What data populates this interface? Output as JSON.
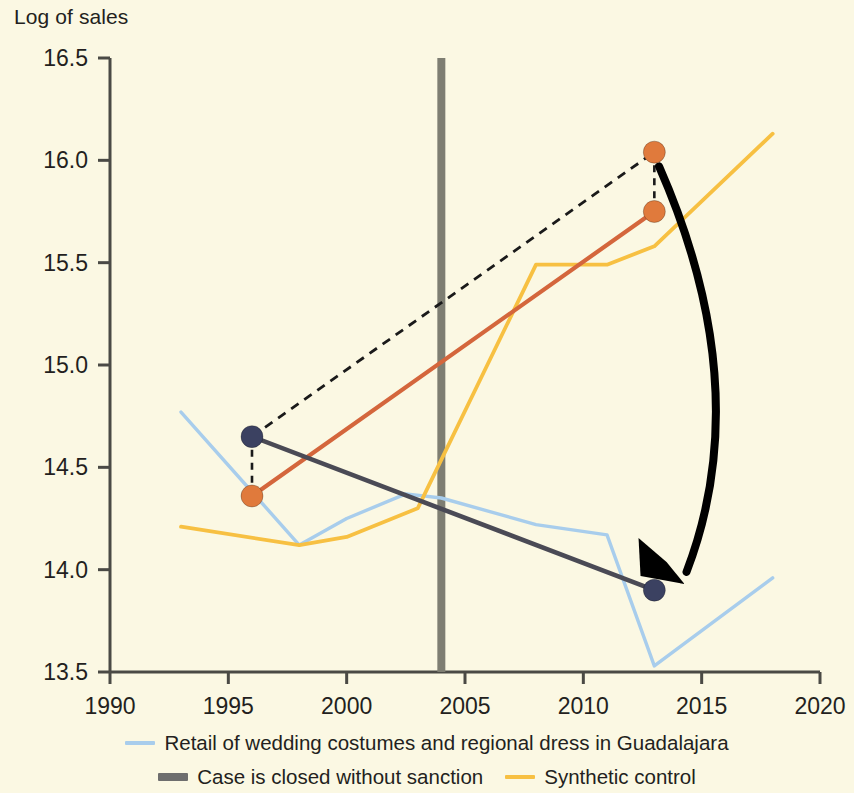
{
  "axis": {
    "y_title": "Log of sales",
    "y_ticks": [
      "13.5",
      "14.0",
      "14.5",
      "15.0",
      "15.5",
      "16.0",
      "16.5"
    ],
    "x_ticks": [
      "1990",
      "1995",
      "2000",
      "2005",
      "2010",
      "2015",
      "2020"
    ]
  },
  "legend": {
    "items": [
      {
        "label": "Retail of wedding costumes and regional dress in Guadalajara",
        "color": "#A8CDEC",
        "weight": "thin"
      },
      {
        "label": "Case is closed without sanction",
        "color": "#6E6E6E",
        "weight": "thick"
      },
      {
        "label": "Synthetic control",
        "color": "#F7C042",
        "weight": "thin"
      }
    ]
  },
  "colors": {
    "background": "#FBF8E3",
    "axis": "#4A4A45",
    "light_blue": "#A8CDEC",
    "yellow": "#F7C042",
    "orange_line": "#D4663C",
    "orange_dot": "#E07A3C",
    "navy_dot": "#3B4161",
    "dark_gray_line": "#4A4A55",
    "event_line": "#7E7E72",
    "arrow": "#000000",
    "dashed": "#1A1A1A"
  },
  "chart_data": {
    "type": "line",
    "title": "",
    "xlabel": "",
    "ylabel": "Log of sales",
    "xlim": [
      1990,
      2020
    ],
    "ylim": [
      13.5,
      16.5
    ],
    "grid": false,
    "legend_position": "bottom",
    "series": [
      {
        "name": "Retail of wedding costumes and regional dress in Guadalajara",
        "color": "#A8CDEC",
        "type": "line",
        "x": [
          1993,
          1998,
          2000,
          2002.5,
          2004,
          2008,
          2011,
          2013,
          2018
        ],
        "values": [
          14.77,
          14.12,
          14.25,
          14.37,
          14.35,
          14.22,
          14.17,
          13.53,
          13.96
        ]
      },
      {
        "name": "Synthetic control",
        "color": "#F7C042",
        "type": "line",
        "x": [
          1993,
          1998,
          2000,
          2003,
          2008,
          2011,
          2013,
          2018
        ],
        "values": [
          14.21,
          14.12,
          14.16,
          14.3,
          15.49,
          15.49,
          15.58,
          16.13
        ]
      },
      {
        "name": "Counterfactual trend (orange)",
        "color": "#D4663C",
        "type": "line",
        "x": [
          1996,
          2013
        ],
        "values": [
          14.36,
          15.75
        ]
      },
      {
        "name": "Observed trend (dark)",
        "color": "#4A4A55",
        "type": "line",
        "x": [
          1996,
          2013
        ],
        "values": [
          14.65,
          13.9
        ]
      },
      {
        "name": "Dashed projection",
        "color": "#1A1A1A",
        "type": "line",
        "style": "dashed",
        "x": [
          1996,
          2013
        ],
        "values": [
          14.65,
          16.04
        ]
      }
    ],
    "points": [
      {
        "name": "navy-left",
        "x": 1996,
        "y": 14.65,
        "color": "#3B4161"
      },
      {
        "name": "orange-left",
        "x": 1996,
        "y": 14.36,
        "color": "#E07A3C"
      },
      {
        "name": "orange-top-right",
        "x": 2013,
        "y": 16.04,
        "color": "#E07A3C"
      },
      {
        "name": "orange-right",
        "x": 2013,
        "y": 15.75,
        "color": "#E07A3C"
      },
      {
        "name": "navy-right",
        "x": 2013,
        "y": 13.9,
        "color": "#3B4161"
      }
    ],
    "connectors": [
      {
        "name": "left-gap",
        "x": 1996,
        "y_from": 14.65,
        "y_to": 14.36,
        "style": "dashed"
      },
      {
        "name": "right-gap",
        "x": 2013,
        "y_from": 16.04,
        "y_to": 15.75,
        "style": "dashed"
      }
    ],
    "annotations": [
      {
        "name": "event-line",
        "type": "vline",
        "x": 2004,
        "label": "Case is closed without sanction",
        "color": "#7E7E72"
      },
      {
        "name": "effect-arrow",
        "type": "curved-arrow",
        "from": {
          "x": 2013.2,
          "y": 15.97
        },
        "to": {
          "x": 2013.6,
          "y": 13.95
        },
        "color": "#000000"
      }
    ]
  }
}
